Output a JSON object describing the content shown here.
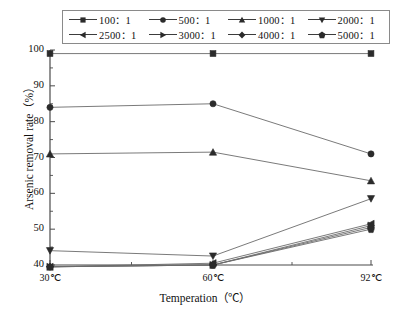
{
  "chart_data": {
    "type": "line",
    "title": "",
    "xlabel": "Temperation（℃）",
    "ylabel": "Arsenic removal rate（%）",
    "categories": [
      "30℃",
      "60℃",
      "92℃"
    ],
    "ylim": [
      40,
      100
    ],
    "yticks": [
      40,
      50,
      60,
      70,
      80,
      90,
      100
    ],
    "ytick_labels": [
      "40",
      "50",
      "60",
      "70",
      "80",
      "90",
      "100"
    ],
    "grid": false,
    "legend_position": "top",
    "series": [
      {
        "name": "100：1",
        "marker": "square",
        "values": [
          99.0,
          99.0,
          99.0
        ]
      },
      {
        "name": "500：1",
        "marker": "circle",
        "values": [
          84.0,
          85.0,
          71.0
        ]
      },
      {
        "name": "1000：1",
        "marker": "triangle-up",
        "values": [
          71.0,
          71.5,
          63.5
        ]
      },
      {
        "name": "2000：1",
        "marker": "triangle-down",
        "values": [
          44.0,
          42.5,
          58.5
        ]
      },
      {
        "name": "2500：1",
        "marker": "triangle-left",
        "values": [
          39.5,
          40.5,
          51.5
        ]
      },
      {
        "name": "3000：1",
        "marker": "triangle-right",
        "values": [
          39.5,
          40.0,
          51.0
        ]
      },
      {
        "name": "4000：1",
        "marker": "diamond",
        "values": [
          39.5,
          40.0,
          50.5
        ]
      },
      {
        "name": "5000：1",
        "marker": "pentagon",
        "values": [
          39.5,
          40.0,
          50.0
        ]
      }
    ]
  },
  "legend": {
    "rows": [
      [
        "100：1",
        "500：1",
        "1000：1",
        "2000：1"
      ],
      [
        "2500：1",
        "3000：1",
        "4000：1",
        "5000：1"
      ]
    ]
  },
  "colors": {
    "line": "#6b6b6b",
    "marker": "#2b2b2b",
    "axis": "#4a4a4a",
    "legend_border": "#8a8a8a",
    "background": "#ffffff"
  }
}
